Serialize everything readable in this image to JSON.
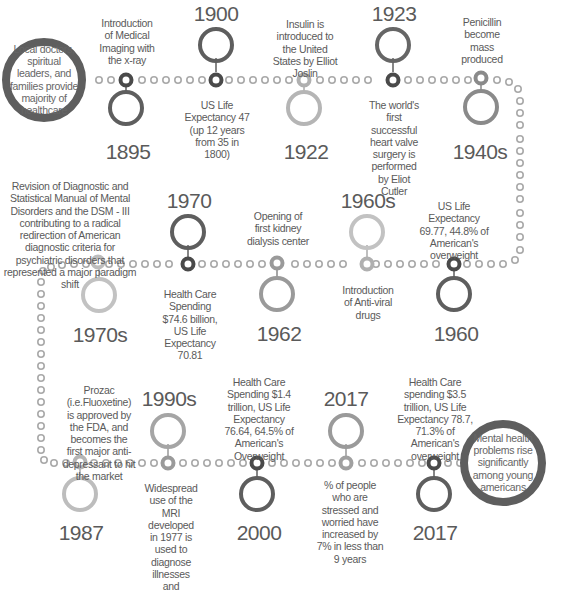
{
  "start_node": {
    "text": "Local doctors, spiritual leaders, and families provide majority of healthcare"
  },
  "end_node": {
    "text": "Mental health problems rise significantly among young americans"
  },
  "rows": [
    {
      "events": [
        {
          "year": "1895",
          "text": "Introduction of Medical Imaging with the x-ray"
        },
        {
          "year": "1900",
          "text": "US Life Expectancy 47 (up 12 years from 35 in 1800)"
        },
        {
          "year": "1922",
          "text": "Insulin is introduced to the United States by Elliot Joslin"
        },
        {
          "year": "1923",
          "text": "The world's first successful heart valve surgery is performed by Eliot Cutler"
        },
        {
          "year": "1940s",
          "text": "Penicillin become mass produced"
        }
      ]
    },
    {
      "events": [
        {
          "year": "1960",
          "text": "US Life Expectancy 69.77, 44.8% of American's overweight"
        },
        {
          "year": "1960s",
          "text": "Introduction of Anti-viral drugs"
        },
        {
          "year": "1962",
          "text": "Opening of first kidney dialysis center"
        },
        {
          "year": "1970",
          "text": "Health Care Spending $74.6 billion, US Life Expectancy 70.81"
        },
        {
          "year": "1970s",
          "text": "Revision of Diagnostic and Statistical Manual of Mental Disorders and the DSM - III contributing to a radical redirection of American diagnostic criteria for psychiatric disorders that represented a major paradigm shift"
        }
      ]
    },
    {
      "events": [
        {
          "year": "1987",
          "text": "Prozac (i.e.Fluoxetine) is approved by the FDA, and becomes the first major anti-depressant to hit the market"
        },
        {
          "year": "1990s",
          "text": "Widespread use of the MRI developed in 1977 is used to diagnose illnesses and"
        },
        {
          "year": "2000",
          "text": "Health Care Spending $1.4 trillion, US Life Expectancy 76.64, 64.5% of American's Overweight"
        },
        {
          "year": "2017",
          "text": "% of people who are stressed and worried have increased by 7% in less than 9 years"
        },
        {
          "year": "2017",
          "text": "Health Care spending $3.5 trillion, US Life Expectancy 78.7, 71.3% of American's overweight"
        }
      ]
    }
  ],
  "colors": {
    "dark_ring": "#5e5e5e",
    "mid_ring": "#8a8a8a",
    "light_ring": "#bdbdbd",
    "dot": "#a9a9a9",
    "text": "#5a5a5a"
  }
}
